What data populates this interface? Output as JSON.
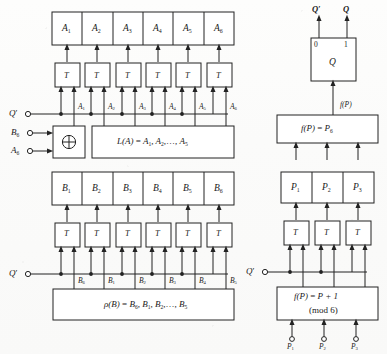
{
  "figure": {
    "kind": "register-transfer logic diagram"
  },
  "left_panel": {
    "register_a": {
      "name": "A register",
      "cells": [
        "A1",
        "A2",
        "A3",
        "A4",
        "A5",
        "A6"
      ],
      "cell_labels": [
        {
          "base": "A",
          "sub": "1"
        },
        {
          "base": "A",
          "sub": "2"
        },
        {
          "base": "A",
          "sub": "3"
        },
        {
          "base": "A",
          "sub": "4"
        },
        {
          "base": "A",
          "sub": "5"
        },
        {
          "base": "A",
          "sub": "6"
        }
      ]
    },
    "flipflops_a": {
      "type": "T",
      "label": "T",
      "count": 6
    },
    "signal_labels_a": [
      {
        "base": "A",
        "sub": "1"
      },
      {
        "base": "A",
        "sub": "2"
      },
      {
        "base": "A",
        "sub": "3"
      },
      {
        "base": "A",
        "sub": "4"
      },
      {
        "base": "A",
        "sub": "5"
      },
      {
        "base": "A",
        "sub": "6"
      }
    ],
    "terminals_a": [
      {
        "base": "Q",
        "sub": "",
        "prime": true
      },
      {
        "base": "B",
        "sub": "6",
        "prime": false
      },
      {
        "base": "A",
        "sub": "6",
        "prime": false
      }
    ],
    "xor_gate": {
      "symbol": "⊕",
      "name": "exclusive-or"
    },
    "function_box_a": {
      "lhs": "L(A)",
      "eq": "=",
      "rhs_terms": [
        "A1",
        "A2"
      ],
      "ellipsis": ",…,",
      "rhs_last": "A5",
      "full": "L(A) = A1, A2, …, A5"
    },
    "register_b": {
      "name": "B register",
      "cells": [
        "B1",
        "B2",
        "B3",
        "B4",
        "B5",
        "B6"
      ],
      "cell_labels": [
        {
          "base": "B",
          "sub": "1"
        },
        {
          "base": "B",
          "sub": "2"
        },
        {
          "base": "B",
          "sub": "3"
        },
        {
          "base": "B",
          "sub": "4"
        },
        {
          "base": "B",
          "sub": "5"
        },
        {
          "base": "B",
          "sub": "6"
        }
      ]
    },
    "flipflops_b": {
      "type": "T",
      "label": "T",
      "count": 6
    },
    "signal_labels_b": [
      {
        "base": "B",
        "sub": "6"
      },
      {
        "base": "B",
        "sub": "1"
      },
      {
        "base": "B",
        "sub": "2"
      },
      {
        "base": "B",
        "sub": "3"
      },
      {
        "base": "B",
        "sub": "4"
      },
      {
        "base": "B",
        "sub": "5"
      }
    ],
    "terminals_b": [
      {
        "base": "Q",
        "sub": "",
        "prime": true
      }
    ],
    "function_box_b": {
      "lhs": "ρ(B)",
      "eq": "=",
      "rhs_first": "B6",
      "rhs_terms": [
        "B1",
        "B2"
      ],
      "ellipsis": ",…,",
      "rhs_last": "B5",
      "full": "ρ(B) = B6, B1, B2, …, B5"
    }
  },
  "right_panel": {
    "q_flipflop": {
      "name": "Q",
      "body_label": "Q",
      "terminal_0": "0",
      "terminal_1": "1",
      "output_left": "Q'",
      "output_right": "Q"
    },
    "feedback_label": "f(P)",
    "function_box_upper": {
      "lhs": "f(P)",
      "eq": "=",
      "rhs_base": "P",
      "rhs_sub": "6",
      "full": "f(P) = P6"
    },
    "register_p": {
      "name": "P register",
      "cells": [
        "P1",
        "P2",
        "P3"
      ],
      "cell_labels": [
        {
          "base": "P",
          "sub": "1"
        },
        {
          "base": "P",
          "sub": "2"
        },
        {
          "base": "P",
          "sub": "3"
        }
      ]
    },
    "flipflops_p": {
      "type": "T",
      "label": "T",
      "count": 3
    },
    "terminals_p": [
      {
        "base": "Q",
        "sub": "",
        "prime": true
      }
    ],
    "function_box_lower": {
      "line1_lhs": "f(P)",
      "line1_eq": "=",
      "line1_rhs": "P + 1",
      "line2": "(mod 6)",
      "full": "f(P) = P + 1 (mod 6)"
    },
    "inputs_p": [
      {
        "base": "P",
        "sub": "1"
      },
      {
        "base": "P",
        "sub": "2"
      },
      {
        "base": "P",
        "sub": "3"
      }
    ]
  },
  "colors": {
    "ink": "#1a1a1a",
    "line": "#222222",
    "paper": "#fbfbfa",
    "box_fill": "#ffffff"
  }
}
